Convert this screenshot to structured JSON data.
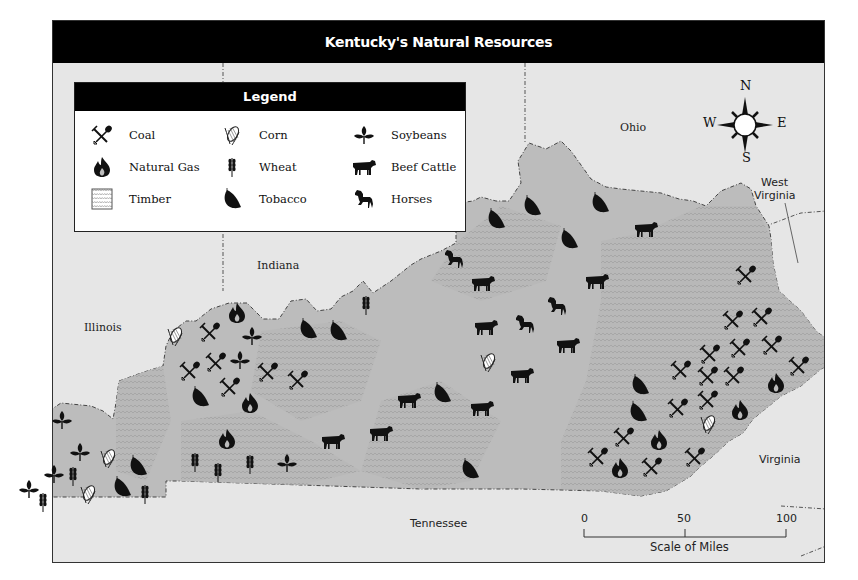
{
  "title": "Kentucky's Natural Resources",
  "legend": {
    "heading": "Legend",
    "items": [
      {
        "key": "coal",
        "label": "Coal",
        "icon": "pick-shovel-icon"
      },
      {
        "key": "gas",
        "label": "Natural Gas",
        "icon": "flame-icon"
      },
      {
        "key": "timber",
        "label": "Timber",
        "icon": "timber-pattern-icon"
      },
      {
        "key": "corn",
        "label": "Corn",
        "icon": "corn-icon"
      },
      {
        "key": "wheat",
        "label": "Wheat",
        "icon": "wheat-icon"
      },
      {
        "key": "tobacco",
        "label": "Tobacco",
        "icon": "tobacco-leaf-icon"
      },
      {
        "key": "soy",
        "label": "Soybeans",
        "icon": "soybean-plant-icon"
      },
      {
        "key": "cattle",
        "label": "Beef Cattle",
        "icon": "cow-icon"
      },
      {
        "key": "horse",
        "label": "Horses",
        "icon": "horse-icon"
      }
    ]
  },
  "neighbors": {
    "ohio": "Ohio",
    "indiana": "Indiana",
    "illinois": "Illinois",
    "west_virginia_1": "West",
    "west_virginia_2": "Virginia",
    "virginia": "Virginia",
    "tennessee": "Tennessee"
  },
  "compass": {
    "n": "N",
    "s": "S",
    "e": "E",
    "w": "W"
  },
  "scale": {
    "label": "Scale of Miles",
    "ticks": [
      "0",
      "50",
      "100"
    ]
  },
  "colors": {
    "background": "#e6e6e6",
    "state_fill": "#bdbdbd",
    "title_bar": "#000000"
  },
  "markers": [
    {
      "type": "soy",
      "x": 62,
      "y": 420
    },
    {
      "type": "soy",
      "x": 80,
      "y": 452
    },
    {
      "type": "soy",
      "x": 54,
      "y": 474
    },
    {
      "type": "soy",
      "x": 29,
      "y": 489
    },
    {
      "type": "soy",
      "x": 252,
      "y": 336
    },
    {
      "type": "soy",
      "x": 240,
      "y": 360
    },
    {
      "type": "soy",
      "x": 287,
      "y": 463
    },
    {
      "type": "corn",
      "x": 108,
      "y": 458
    },
    {
      "type": "corn",
      "x": 88,
      "y": 494
    },
    {
      "type": "corn",
      "x": 175,
      "y": 336
    },
    {
      "type": "corn",
      "x": 488,
      "y": 362
    },
    {
      "type": "corn",
      "x": 708,
      "y": 424
    },
    {
      "type": "wheat",
      "x": 73,
      "y": 476
    },
    {
      "type": "wheat",
      "x": 43,
      "y": 502
    },
    {
      "type": "wheat",
      "x": 145,
      "y": 494
    },
    {
      "type": "wheat",
      "x": 195,
      "y": 462
    },
    {
      "type": "wheat",
      "x": 218,
      "y": 472
    },
    {
      "type": "wheat",
      "x": 250,
      "y": 464
    },
    {
      "type": "wheat",
      "x": 366,
      "y": 305
    },
    {
      "type": "tobacco",
      "x": 138,
      "y": 466
    },
    {
      "type": "tobacco",
      "x": 122,
      "y": 487
    },
    {
      "type": "tobacco",
      "x": 200,
      "y": 397
    },
    {
      "type": "tobacco",
      "x": 308,
      "y": 329
    },
    {
      "type": "tobacco",
      "x": 338,
      "y": 331
    },
    {
      "type": "tobacco",
      "x": 442,
      "y": 393
    },
    {
      "type": "tobacco",
      "x": 470,
      "y": 469
    },
    {
      "type": "tobacco",
      "x": 496,
      "y": 219
    },
    {
      "type": "tobacco",
      "x": 532,
      "y": 206
    },
    {
      "type": "tobacco",
      "x": 569,
      "y": 239
    },
    {
      "type": "tobacco",
      "x": 600,
      "y": 203
    },
    {
      "type": "tobacco",
      "x": 640,
      "y": 385
    },
    {
      "type": "tobacco",
      "x": 638,
      "y": 412
    },
    {
      "type": "gas",
      "x": 237,
      "y": 313
    },
    {
      "type": "gas",
      "x": 250,
      "y": 403
    },
    {
      "type": "gas",
      "x": 227,
      "y": 439
    },
    {
      "type": "gas",
      "x": 659,
      "y": 440
    },
    {
      "type": "gas",
      "x": 620,
      "y": 468
    },
    {
      "type": "gas",
      "x": 740,
      "y": 410
    },
    {
      "type": "gas",
      "x": 776,
      "y": 383
    },
    {
      "type": "coal",
      "x": 210,
      "y": 332
    },
    {
      "type": "coal",
      "x": 216,
      "y": 362
    },
    {
      "type": "coal",
      "x": 190,
      "y": 371
    },
    {
      "type": "coal",
      "x": 230,
      "y": 387
    },
    {
      "type": "coal",
      "x": 268,
      "y": 372
    },
    {
      "type": "coal",
      "x": 298,
      "y": 380
    },
    {
      "type": "coal",
      "x": 746,
      "y": 275
    },
    {
      "type": "coal",
      "x": 733,
      "y": 320
    },
    {
      "type": "coal",
      "x": 762,
      "y": 317
    },
    {
      "type": "coal",
      "x": 740,
      "y": 348
    },
    {
      "type": "coal",
      "x": 772,
      "y": 345
    },
    {
      "type": "coal",
      "x": 710,
      "y": 354
    },
    {
      "type": "coal",
      "x": 681,
      "y": 370
    },
    {
      "type": "coal",
      "x": 708,
      "y": 376
    },
    {
      "type": "coal",
      "x": 734,
      "y": 376
    },
    {
      "type": "coal",
      "x": 799,
      "y": 366
    },
    {
      "type": "coal",
      "x": 678,
      "y": 408
    },
    {
      "type": "coal",
      "x": 708,
      "y": 400
    },
    {
      "type": "coal",
      "x": 624,
      "y": 437
    },
    {
      "type": "coal",
      "x": 598,
      "y": 457
    },
    {
      "type": "coal",
      "x": 652,
      "y": 467
    },
    {
      "type": "coal",
      "x": 695,
      "y": 457
    },
    {
      "type": "cattle",
      "x": 646,
      "y": 229
    },
    {
      "type": "cattle",
      "x": 483,
      "y": 283
    },
    {
      "type": "cattle",
      "x": 597,
      "y": 281
    },
    {
      "type": "cattle",
      "x": 486,
      "y": 327
    },
    {
      "type": "cattle",
      "x": 568,
      "y": 345
    },
    {
      "type": "cattle",
      "x": 522,
      "y": 375
    },
    {
      "type": "cattle",
      "x": 409,
      "y": 400
    },
    {
      "type": "cattle",
      "x": 482,
      "y": 408
    },
    {
      "type": "cattle",
      "x": 381,
      "y": 433
    },
    {
      "type": "cattle",
      "x": 333,
      "y": 441
    },
    {
      "type": "horse",
      "x": 454,
      "y": 259
    },
    {
      "type": "horse",
      "x": 525,
      "y": 324
    },
    {
      "type": "horse",
      "x": 557,
      "y": 306
    }
  ]
}
